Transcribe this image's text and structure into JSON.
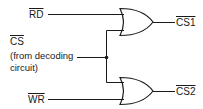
{
  "diagram": {
    "type": "logic-circuit",
    "gates": [
      {
        "id": "gate-top",
        "type": "OR",
        "inputs": [
          "RD",
          "CS"
        ],
        "output": "CS1"
      },
      {
        "id": "gate-bottom",
        "type": "OR",
        "inputs": [
          "CS",
          "WR"
        ],
        "output": "CS2"
      }
    ],
    "labels": {
      "rd": "RD",
      "wr": "WR",
      "cs": "CS",
      "cs_note_line1": "(from decoding",
      "cs_note_line2": "circuit)",
      "cs1": "CS1",
      "cs2": "CS2"
    },
    "colors": {
      "line": "#1a1a1a",
      "background": "#ffffff"
    }
  }
}
